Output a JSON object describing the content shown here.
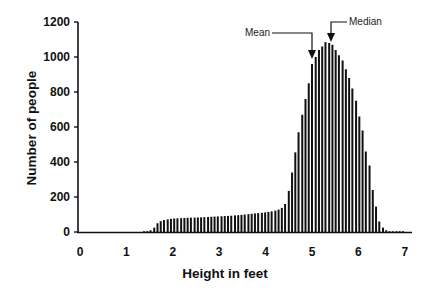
{
  "chart_data": {
    "type": "bar",
    "title": "",
    "xlabel": "Height in feet",
    "ylabel": "Number of people",
    "xlim": [
      0,
      7.1
    ],
    "ylim": [
      0,
      1200
    ],
    "xticks": [
      "0",
      "1",
      "2",
      "3",
      "4",
      "5",
      "6",
      "7"
    ],
    "yticks": [
      "0",
      "200",
      "400",
      "600",
      "800",
      "1000",
      "1200"
    ],
    "grid": false,
    "legend": null,
    "bar_color": "#111111",
    "bar_spacing_ft": 0.0725,
    "x": [
      1.38,
      1.45,
      1.52,
      1.6,
      1.67,
      1.74,
      1.81,
      1.89,
      1.96,
      2.03,
      2.1,
      2.18,
      2.25,
      2.32,
      2.39,
      2.47,
      2.54,
      2.61,
      2.68,
      2.76,
      2.83,
      2.9,
      2.97,
      3.05,
      3.12,
      3.19,
      3.26,
      3.34,
      3.41,
      3.48,
      3.55,
      3.63,
      3.7,
      3.77,
      3.84,
      3.92,
      3.99,
      4.06,
      4.13,
      4.21,
      4.28,
      4.35,
      4.42,
      4.5,
      4.57,
      4.64,
      4.71,
      4.79,
      4.86,
      4.93,
      5.0,
      5.08,
      5.15,
      5.22,
      5.29,
      5.37,
      5.44,
      5.51,
      5.58,
      5.66,
      5.73,
      5.8,
      5.87,
      5.95,
      6.02,
      6.09,
      6.16,
      6.24,
      6.31,
      6.38,
      6.45,
      6.53,
      6.6,
      6.67,
      6.74,
      6.82,
      6.89,
      6.96
    ],
    "values": [
      2,
      5,
      10,
      25,
      50,
      62,
      68,
      72,
      75,
      77,
      78,
      79,
      80,
      81,
      82,
      82,
      83,
      84,
      85,
      86,
      87,
      88,
      89,
      90,
      91,
      92,
      93,
      95,
      96,
      98,
      100,
      102,
      104,
      106,
      108,
      110,
      112,
      115,
      118,
      122,
      128,
      138,
      160,
      235,
      340,
      455,
      570,
      670,
      760,
      850,
      960,
      1000,
      1040,
      1060,
      1085,
      1080,
      1070,
      1040,
      1010,
      980,
      930,
      880,
      820,
      750,
      660,
      580,
      460,
      380,
      240,
      145,
      60,
      25,
      10,
      4,
      2,
      1,
      1,
      1
    ],
    "annotations": [
      {
        "label": "Mean",
        "x": 5.0,
        "arrow_to_y": 1010
      },
      {
        "label": "Median",
        "x": 5.3,
        "arrow_to_y": 1085
      }
    ]
  },
  "labels": {
    "xlabel": "Height in feet",
    "ylabel": "Number of people",
    "mean": "Mean",
    "median": "Median"
  }
}
